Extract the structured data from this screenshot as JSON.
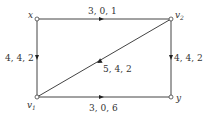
{
  "nodes": [
    {
      "id": "x",
      "label": "x",
      "sub": "",
      "cx": 37,
      "cy": 19,
      "lx": 28,
      "ly": 18
    },
    {
      "id": "v2",
      "label": "v",
      "sub": "2",
      "cx": 171,
      "cy": 19,
      "lx": 175,
      "ly": 18
    },
    {
      "id": "v1",
      "label": "v",
      "sub": "1",
      "cx": 37,
      "cy": 97,
      "lx": 27,
      "ly": 108
    },
    {
      "id": "y",
      "label": "y",
      "sub": "",
      "cx": 171,
      "cy": 97,
      "lx": 176,
      "ly": 101
    }
  ],
  "edges": [
    {
      "from": "x",
      "to": "v2",
      "label": "3, 0, 1",
      "lx": 104,
      "ly": 14
    },
    {
      "from": "x",
      "to": "v1",
      "label": "4, 4, 2",
      "lx": 6,
      "ly": 61
    },
    {
      "from": "v2",
      "to": "y",
      "label": "4, 4, 2",
      "lx": 174,
      "ly": 61
    },
    {
      "from": "v2",
      "to": "v1",
      "label": "5, 4, 2",
      "lx": 103,
      "ly": 72
    },
    {
      "from": "v1",
      "to": "y",
      "label": "3, 0, 6",
      "lx": 89,
      "ly": 111
    }
  ]
}
